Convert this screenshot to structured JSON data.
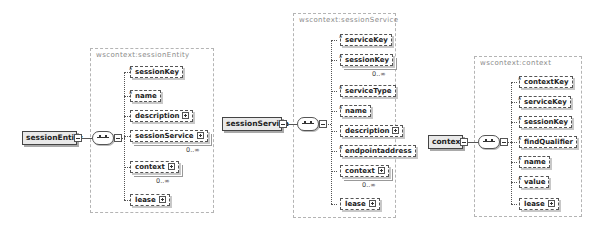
{
  "diagrams": [
    {
      "root": "sessionEntity",
      "group_label": "wscontext:sessionEntity",
      "children": [
        {
          "name": "sessionKey",
          "attr_mark": "a",
          "expandable": false,
          "occurrence": ""
        },
        {
          "name": "name",
          "attr_mark": "a",
          "expandable": false,
          "occurrence": ""
        },
        {
          "name": "description",
          "attr_mark": "",
          "expandable": true,
          "occurrence": ""
        },
        {
          "name": "sessionService",
          "attr_mark": "",
          "expandable": true,
          "occurrence": "0..∞"
        },
        {
          "name": "context",
          "attr_mark": "",
          "expandable": true,
          "occurrence": "0..∞"
        },
        {
          "name": "lease",
          "attr_mark": "",
          "expandable": true,
          "occurrence": ""
        }
      ]
    },
    {
      "root": "sessionService",
      "group_label": "wscontext:sessionService",
      "children": [
        {
          "name": "serviceKey",
          "attr_mark": "a",
          "expandable": false,
          "occurrence": ""
        },
        {
          "name": "sessionKey",
          "attr_mark": "a",
          "expandable": false,
          "occurrence": "0..∞"
        },
        {
          "name": "serviceType",
          "attr_mark": "a",
          "expandable": false,
          "occurrence": ""
        },
        {
          "name": "name",
          "attr_mark": "a",
          "expandable": false,
          "occurrence": ""
        },
        {
          "name": "description",
          "attr_mark": "",
          "expandable": true,
          "occurrence": ""
        },
        {
          "name": "endpointaddress",
          "attr_mark": "a",
          "expandable": false,
          "occurrence": ""
        },
        {
          "name": "context",
          "attr_mark": "",
          "expandable": true,
          "occurrence": "0..∞"
        },
        {
          "name": "lease",
          "attr_mark": "",
          "expandable": true,
          "occurrence": ""
        }
      ]
    },
    {
      "root": "context",
      "group_label": "wscontext:context",
      "children": [
        {
          "name": "contextKey",
          "attr_mark": "a",
          "expandable": false,
          "occurrence": ""
        },
        {
          "name": "serviceKey",
          "attr_mark": "a",
          "expandable": false,
          "occurrence": ""
        },
        {
          "name": "sessionKey",
          "attr_mark": "a",
          "expandable": false,
          "occurrence": ""
        },
        {
          "name": "findQualifier",
          "attr_mark": "a",
          "expandable": false,
          "occurrence": ""
        },
        {
          "name": "name",
          "attr_mark": "a",
          "expandable": false,
          "occurrence": ""
        },
        {
          "name": "value",
          "attr_mark": "a",
          "expandable": false,
          "occurrence": ""
        },
        {
          "name": "lease",
          "attr_mark": "",
          "expandable": true,
          "occurrence": ""
        }
      ]
    }
  ]
}
